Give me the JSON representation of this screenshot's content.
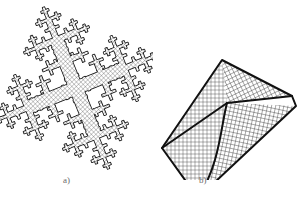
{
  "figure": {
    "background_color": "#ffffff",
    "ink_color": "#1a1a1a",
    "mesh_line_color": "#3a3a3a",
    "caption_color": "#6b6b6b",
    "width": 307,
    "height": 201
  },
  "panels": [
    {
      "id": "a",
      "caption": "a)",
      "name": "fractal-dendritic-mesh",
      "description": "Quadrilateral finite-element mesh covering a self-similar cross-shaped (Vicsek-type) fractal dendrite, rotated about 20 degrees",
      "mesh": {
        "cell_size_px": 3.2,
        "line_width_px": 0.35,
        "fill": "#ffffff",
        "stroke": "#333333"
      },
      "fractal": {
        "type": "cross-dendrite",
        "levels": 3,
        "rotation_deg": -22,
        "arm_ratio": 0.42,
        "child_scale": 0.42,
        "center_x": 76,
        "center_y": 88,
        "base_arm_length": 52,
        "base_arm_half_width": 6.5
      }
    },
    {
      "id": "b",
      "caption": "b)",
      "name": "three-block-structured-mesh",
      "description": "Kite-shaped domain partitioned into three structured quadrilateral mesh blocks meeting at an interior Y-junction with curved interfaces",
      "mesh": {
        "cell_size_px": 4.0,
        "line_width_px": 0.4,
        "fill": "#ffffff",
        "stroke": "#333333"
      },
      "outline": {
        "stroke": "#111111",
        "stroke_width_px": 2.0
      },
      "vertices": {
        "top_left": [
          72,
          60
        ],
        "left": [
          12,
          148
        ],
        "bottom": [
          48,
          198
        ],
        "right_tip": [
          146,
          106
        ],
        "far_right": [
          142,
          96
        ],
        "junction": [
          77,
          103
        ]
      },
      "blocks": [
        {
          "name": "upper-block",
          "orientation_deg": -26,
          "rows": 14,
          "cols": 40
        },
        {
          "name": "left-block",
          "orientation_deg": 0,
          "rows": 22,
          "cols": 17
        },
        {
          "name": "lower-right-block",
          "orientation_deg": 12,
          "rows": 16,
          "cols": 38
        }
      ]
    }
  ]
}
